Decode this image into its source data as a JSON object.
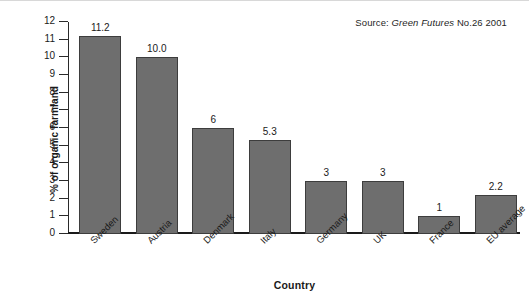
{
  "source": {
    "prefix": "Source:",
    "publication": "Green Futures",
    "issue": "No.26 2001",
    "full": "Source: Green Futures No.26 2001"
  },
  "chart_data": {
    "type": "bar",
    "title": "",
    "xlabel": "Country",
    "ylabel": "% of organic farmland",
    "categories": [
      "Sweden",
      "Austria",
      "Denmark",
      "Italy",
      "Germany",
      "UK",
      "France",
      "EU average"
    ],
    "values": [
      11.2,
      10.0,
      6,
      5.3,
      3,
      3,
      1,
      2.2
    ],
    "value_labels": [
      "11.2",
      "10.0",
      "6",
      "5.3",
      "3",
      "3",
      "1",
      "2.2"
    ],
    "ylim": [
      0,
      12
    ],
    "ytick_values": [
      12,
      11,
      10,
      9,
      8,
      7,
      6,
      5,
      4,
      3,
      2,
      1,
      0
    ],
    "ytick_labels": [
      "12",
      "11",
      "10",
      "9",
      "8",
      "7",
      "6",
      "5",
      "4",
      "3",
      "2",
      "1",
      "0"
    ],
    "grid": false,
    "legend": "none",
    "bar_color": "#6e6e6e",
    "bar_edge_color": "#3d3d3d",
    "axis_color": "#1a1a1a",
    "background": "#ffffff"
  }
}
